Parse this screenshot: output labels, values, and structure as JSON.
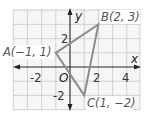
{
  "diagram": {
    "type": "coordinate-plane-triangle",
    "axes": {
      "x_label": "x",
      "y_label": "y",
      "origin_label": "O",
      "x_ticks": [
        "-2",
        "2",
        "4"
      ],
      "y_ticks": [
        "2",
        "-2"
      ]
    },
    "grid": {
      "x_range": [
        -4,
        5
      ],
      "y_range": [
        -4,
        4
      ],
      "step": 1
    },
    "points": [
      {
        "name": "A",
        "label": "A(−1, 1)",
        "x": -1,
        "y": 1
      },
      {
        "name": "B",
        "label": "B(2, 3)",
        "x": 2,
        "y": 3
      },
      {
        "name": "C",
        "label": "C(1, −2)",
        "x": 1,
        "y": -2
      }
    ],
    "colors": {
      "triangle": "#8c8c8c",
      "grid": "#c8c8c8",
      "axis": "#222222"
    }
  }
}
